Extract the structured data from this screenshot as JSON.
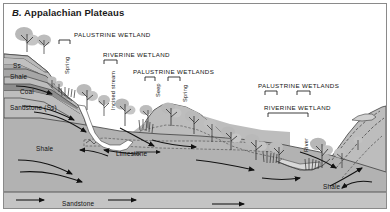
{
  "figure": {
    "panel_letter": "B.",
    "title": "Appalachian Plateaus",
    "border_color": "#8a8a8a",
    "background": "#ffffff"
  },
  "wetland_labels": [
    {
      "id": "palustrine-wetland-1",
      "text": "PALUSTRINE WETLAND",
      "x": 74,
      "y": 31,
      "bracket": {
        "x": 59,
        "y": 40,
        "w": 11
      }
    },
    {
      "id": "riverine-wetland-1",
      "text": "RIVERINE WETLAND",
      "x": 103,
      "y": 51,
      "bracket": {
        "x": 104,
        "y": 60,
        "w": 13
      }
    },
    {
      "id": "palustrine-wetlands-2",
      "text": "PALUSTRINE WETLANDS",
      "x": 133,
      "y": 68,
      "bracket": {
        "x": 145,
        "y": 77,
        "w": 10
      }
    },
    {
      "id": "palustrine-wetlands-3",
      "text": "PALUSTRINE WETLANDS",
      "x": 258,
      "y": 82,
      "bracket": {
        "x": 265,
        "y": 91,
        "w": 12
      }
    },
    {
      "id": "riverine-wetland-2",
      "text": "RIVERINE WETLAND",
      "x": 264,
      "y": 104,
      "bracket": {
        "x": 268,
        "y": 113,
        "w": 40
      }
    }
  ],
  "feature_labels": [
    {
      "id": "spring-1",
      "text": "Spring",
      "x": 64,
      "y": 74,
      "rotated": true
    },
    {
      "id": "incised-stream",
      "text": "Incised stream",
      "x": 110,
      "y": 110,
      "rotated": true
    },
    {
      "id": "seep",
      "text": "Seep",
      "x": 155,
      "y": 97,
      "rotated": true
    },
    {
      "id": "spring-2",
      "text": "Spring",
      "x": 182,
      "y": 102,
      "rotated": true
    },
    {
      "id": "river",
      "text": "River",
      "x": 303,
      "y": 152,
      "rotated": true
    }
  ],
  "strata": [
    {
      "id": "ss-top",
      "label": "Ss",
      "x": 13,
      "y": 62,
      "color": "#b9b9b9"
    },
    {
      "id": "shale-upper",
      "label": "Shale",
      "x": 10,
      "y": 73,
      "color": "#a8a8a8"
    },
    {
      "id": "coal",
      "label": "Coal",
      "x": 20,
      "y": 88,
      "color": "#8d8d8d"
    },
    {
      "id": "sandstone-upper",
      "label": "Sandstone (Ss)",
      "x": 10,
      "y": 104,
      "color": "#bdbdbd"
    },
    {
      "id": "shale-main",
      "label": "Shale",
      "x": 36,
      "y": 145,
      "color": "#b0b0b0"
    },
    {
      "id": "limestone",
      "label": "Limestone",
      "x": 116,
      "y": 150,
      "color": "#b5b5b5"
    },
    {
      "id": "shale-right",
      "label": "Shale",
      "x": 323,
      "y": 183,
      "color": "#b0b0b0"
    },
    {
      "id": "sandstone-base",
      "label": "Sandstone",
      "x": 62,
      "y": 200,
      "color": "#c2c2c2"
    }
  ],
  "colors": {
    "sky": "#ffffff",
    "rock_light": "#c2c2c2",
    "rock_mid": "#b0b0b0",
    "rock_dark": "#8d8d8d",
    "vegetation": "#b8b8b8",
    "water": "#d6d6d6",
    "flow_arrow": "#111111",
    "outline": "#3a3a3a"
  },
  "flow_arrows_count": 14,
  "trees_count": 22
}
